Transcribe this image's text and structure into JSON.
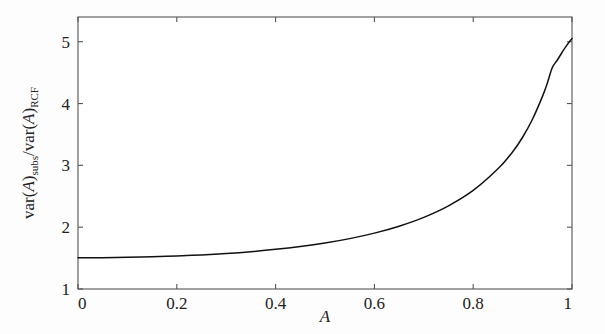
{
  "figure": {
    "background_color": "#fdfdfd",
    "axis_color": "#555555",
    "curve_color": "#111111"
  },
  "axes": {
    "x_title": "A",
    "y_title_parts": {
      "var1": "var(",
      "var1_arg": "A",
      "var1_close": ")",
      "var1_sub": "subs",
      "slash": "/",
      "var2": "var(",
      "var2_arg": "A",
      "var2_close": ")",
      "var2_sub": "RCF"
    },
    "x_tick_labels": [
      "0",
      "0.2",
      "0.4",
      "0.6",
      "0.8",
      "1"
    ],
    "y_tick_labels": [
      "1",
      "2",
      "3",
      "4",
      "5"
    ]
  },
  "chart_data": {
    "type": "line",
    "title": "",
    "xlabel": "A",
    "ylabel": "var(A)subs/var(A)RCF",
    "xlim": [
      0,
      1
    ],
    "ylim": [
      1,
      5.4
    ],
    "xticks": [
      0,
      0.2,
      0.4,
      0.6,
      0.8,
      1
    ],
    "yticks": [
      1,
      2,
      3,
      4,
      5
    ],
    "grid": false,
    "legend": null,
    "series": [
      {
        "name": "var(A)subs/var(A)RCF",
        "x": [
          0.0,
          0.05,
          0.1,
          0.15,
          0.2,
          0.25,
          0.3,
          0.35,
          0.4,
          0.45,
          0.5,
          0.55,
          0.6,
          0.65,
          0.7,
          0.75,
          0.8,
          0.85,
          0.88,
          0.9,
          0.92,
          0.94,
          0.95,
          0.96,
          0.97,
          0.98,
          0.99,
          1.0
        ],
        "y": [
          1.505,
          1.507,
          1.512,
          1.521,
          1.534,
          1.552,
          1.575,
          1.604,
          1.641,
          1.687,
          1.744,
          1.815,
          1.904,
          2.016,
          2.159,
          2.345,
          2.594,
          2.944,
          3.22,
          3.455,
          3.746,
          4.112,
          4.33,
          4.58,
          4.7,
          4.83,
          4.95,
          5.05
        ]
      }
    ]
  }
}
